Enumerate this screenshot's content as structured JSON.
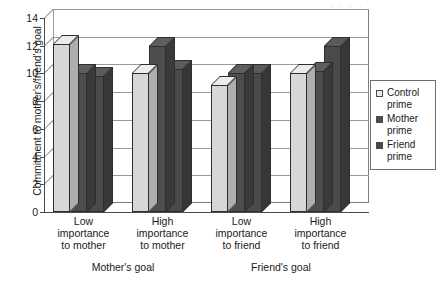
{
  "chart_data": {
    "type": "bar",
    "title": "",
    "subtitle": "",
    "xlabel": "",
    "ylabel": "Commitment to mother's/friend's goal",
    "ylim": [
      0,
      14
    ],
    "ytick_step": 2,
    "yticks": [
      "0",
      "2",
      "4",
      "6",
      "8",
      "10",
      "12",
      "14"
    ],
    "grid": true,
    "style": "3d-grouped-bar",
    "legend_position": "right",
    "categories": [
      "Low\nimportance\nto mother",
      "High\nimportance\nto mother",
      "Low\nimportance\nto friend",
      "High\nimportance\nto friend"
    ],
    "category_lines": [
      [
        "Low",
        "importance",
        "to mother"
      ],
      [
        "High",
        "importance",
        "to mother"
      ],
      [
        "Low",
        "importance",
        "to friend"
      ],
      [
        "High",
        "importance",
        "to friend"
      ]
    ],
    "supergroups": [
      {
        "label": "Mother's goal",
        "categories": [
          0,
          1
        ]
      },
      {
        "label": "Friend's goal",
        "categories": [
          2,
          3
        ]
      }
    ],
    "series": [
      {
        "name": "Control prime",
        "color": "#d7d7d7",
        "values": [
          12.1,
          10.0,
          9.2,
          10.0
        ]
      },
      {
        "name": "Mother prime",
        "color": "#4d4d4d",
        "values": [
          10.0,
          12.0,
          10.0,
          10.2
        ]
      },
      {
        "name": "Friend prime",
        "color": "#4a4a4a",
        "values": [
          9.8,
          10.3,
          10.0,
          12.0
        ]
      }
    ]
  },
  "legend": {
    "items": [
      {
        "label": "Control\nprime",
        "swatch": "light-gray-swatch-icon"
      },
      {
        "label": "Mother\nprime",
        "swatch": "dark-gray-swatch-icon"
      },
      {
        "label": "Friend\nprime",
        "swatch": "dark-gray-swatch-icon"
      }
    ]
  },
  "artifact": {
    "text": "· · · ·"
  }
}
